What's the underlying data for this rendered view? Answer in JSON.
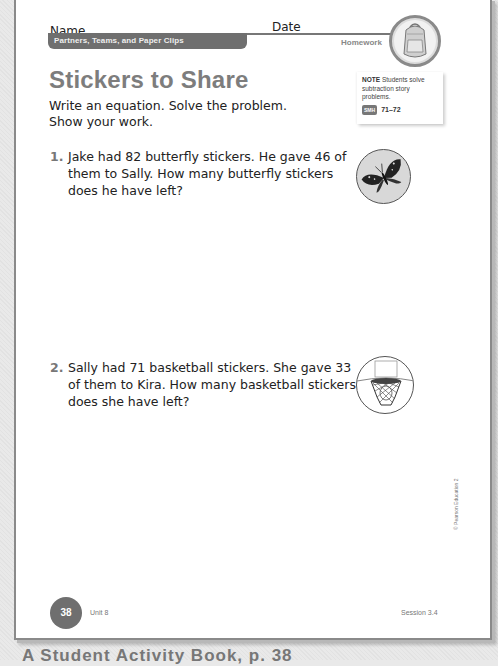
{
  "header": {
    "name_label": "Name",
    "date_label": "Date",
    "unit_title": "Partners, Teams, and Paper Clips",
    "section_label": "Homework",
    "badge_icon": "backpack-icon"
  },
  "title": "Stickers to Share",
  "instructions": {
    "line1": "Write an equation. Solve the problem.",
    "line2": "Show your work."
  },
  "note": {
    "heading": "NOTE",
    "text": "Students solve subtraction story problems.",
    "smh_badge": "SMH",
    "smh_pages": "71–72"
  },
  "problems": [
    {
      "number": "1.",
      "text": "Jake had 82 butterfly stickers. He gave 46 of them to Sally. How many butterfly stickers does he have left?",
      "icon": "butterfly-icon"
    },
    {
      "number": "2.",
      "text": "Sally had 71 basketball stickers. She gave 33 of them to Kira. How many basketball stickers does she have left?",
      "icon": "basketball-hoop-icon"
    }
  ],
  "footer": {
    "page_number": "38",
    "unit": "Unit 8",
    "session": "Session 3.4",
    "copyright": "© Pearson Education 2"
  },
  "caption": "A   Student Activity Book, p. 38",
  "colors": {
    "accent_grey": "#6f6f6f",
    "title_grey": "#7d7d7d",
    "text": "#222222"
  }
}
